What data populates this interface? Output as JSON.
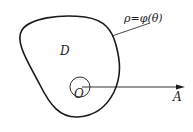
{
  "diagram": {
    "region_label": "D",
    "curve_label": "ρ=φ(θ)",
    "origin_label": "O",
    "axis_label": "A",
    "colors": {
      "stroke": "#1a1a1a",
      "background": "#ffffff"
    }
  }
}
